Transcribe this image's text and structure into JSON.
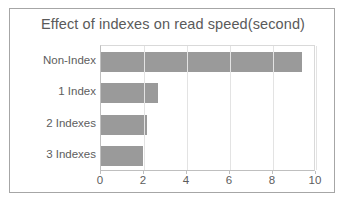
{
  "chart_data": {
    "type": "bar",
    "orientation": "horizontal",
    "title": "Effect of indexes on read speed(second)",
    "xlabel": "",
    "ylabel": "",
    "categories": [
      "Non-Index",
      "1 Index",
      "2 Indexes",
      "3 Indexes"
    ],
    "values": [
      9.35,
      2.65,
      2.15,
      1.95
    ],
    "xlim": [
      0,
      10
    ],
    "xticks": [
      "0",
      "2",
      "4",
      "6",
      "8",
      "10"
    ],
    "xtick_values": [
      0,
      2,
      4,
      6,
      8,
      10
    ],
    "grid": true,
    "legend": false,
    "bar_color": "#9a9a9a",
    "text_color": "#5d5d5d",
    "border_color": "#a6a6a6",
    "gridline_color": "#e3e3e3"
  }
}
